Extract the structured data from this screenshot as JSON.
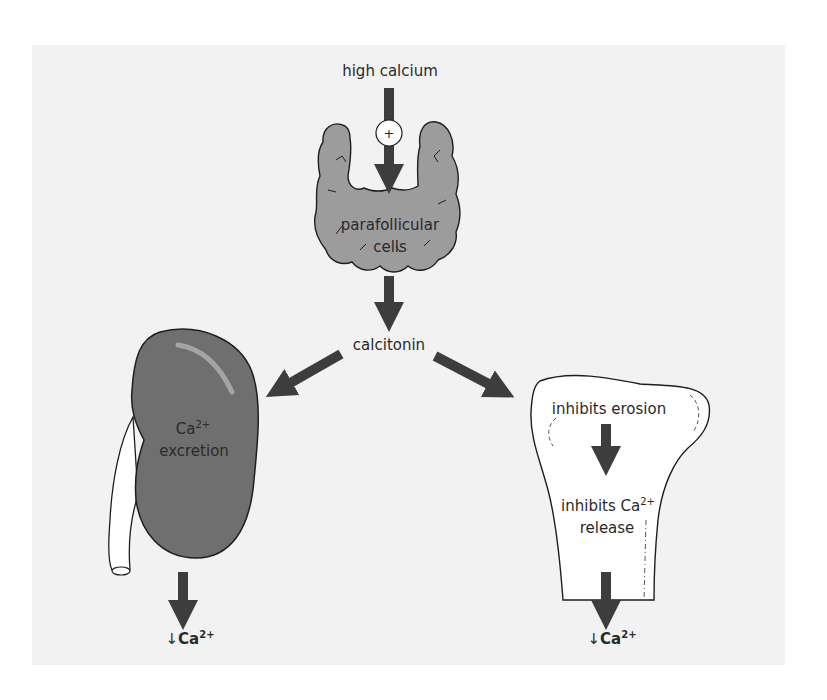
{
  "diagram": {
    "colors": {
      "background_panel": "#f2f2f2",
      "arrow": "#3d3d3d",
      "thyroid_fill": "#9c9c9c",
      "kidney_fill": "#6f6f6f",
      "outline": "#1e1e1e",
      "bone_fill": "#ffffff"
    },
    "nodes": {
      "stimulus": {
        "label": "high calcium"
      },
      "stimulus_sign": {
        "label": "+"
      },
      "gland": {
        "line1": "parafollicular",
        "line2": "cells"
      },
      "hormone": {
        "label": "calcitonin"
      },
      "kidney": {
        "line1_base": "Ca",
        "line1_sup": "2+",
        "line2": "excretion"
      },
      "bone_top": {
        "label": "inhibits erosion"
      },
      "bone_mid": {
        "line1_base": "inhibits Ca",
        "line1_sup": "2+",
        "line2": "release"
      },
      "kidney_result": {
        "prefix": "↓",
        "base": "Ca",
        "sup": "2+"
      },
      "bone_result": {
        "prefix": "↓",
        "base": "Ca",
        "sup": "2+"
      }
    },
    "edges": [
      {
        "from": "high calcium",
        "to": "parafollicular cells",
        "sign": "+"
      },
      {
        "from": "parafollicular cells",
        "to": "calcitonin"
      },
      {
        "from": "calcitonin",
        "to": "kidney"
      },
      {
        "from": "calcitonin",
        "to": "bone"
      },
      {
        "from": "inhibits erosion",
        "to": "inhibits Ca2+ release"
      },
      {
        "from": "kidney",
        "to": "↓Ca2+"
      },
      {
        "from": "bone",
        "to": "↓Ca2+"
      }
    ]
  }
}
